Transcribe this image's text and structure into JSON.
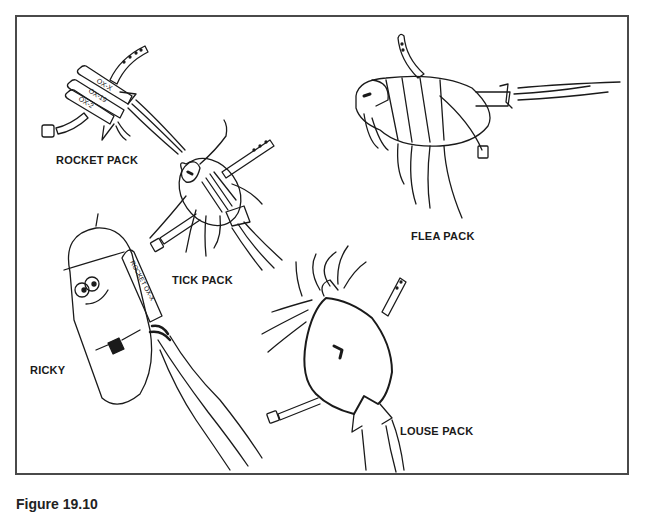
{
  "figure": {
    "caption_partial": "Figure 19.10"
  },
  "labels": {
    "rocket_pack": "ROCKET PACK",
    "tick_pack": "TICK PACK",
    "flea_pack": "FLEA PACK",
    "ricky": "RICKY",
    "louse_pack": "LOUSE PACK"
  },
  "rocket_tube_labels": [
    "OX-X",
    "OX-19",
    "OX-2"
  ],
  "ricky_rocket_label": "ROCKET OX-X",
  "colors": {
    "ink": "#1a1a1a",
    "frame": "#4a4a4a",
    "background": "#ffffff"
  }
}
